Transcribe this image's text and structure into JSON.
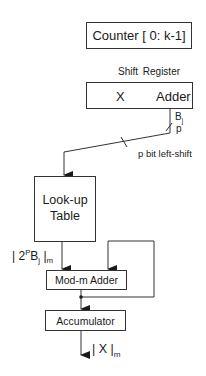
{
  "diagram": {
    "counter": {
      "label": "Counter [ 0: k-1]"
    },
    "shift_register": {
      "title": "Shift Register",
      "left_field": "X",
      "right_field": "Adder"
    },
    "bus": {
      "width_label_top": "B",
      "width_label_top_sub": "j",
      "width_label_bottom": "p",
      "shift_label": "p bit left-shift"
    },
    "lookup_table": {
      "line1": "Look-up",
      "line2": "Table"
    },
    "lut_output": {
      "prefix": "| 2",
      "sup": "P",
      "mid": "B",
      "sub_j": "j",
      "bar": " |",
      "sub_m": "m"
    },
    "mod_adder": {
      "label": "Mod-m Adder"
    },
    "accumulator": {
      "label": "Accumulator"
    },
    "output": {
      "prefix": "| X |",
      "sub_m": "m"
    }
  }
}
